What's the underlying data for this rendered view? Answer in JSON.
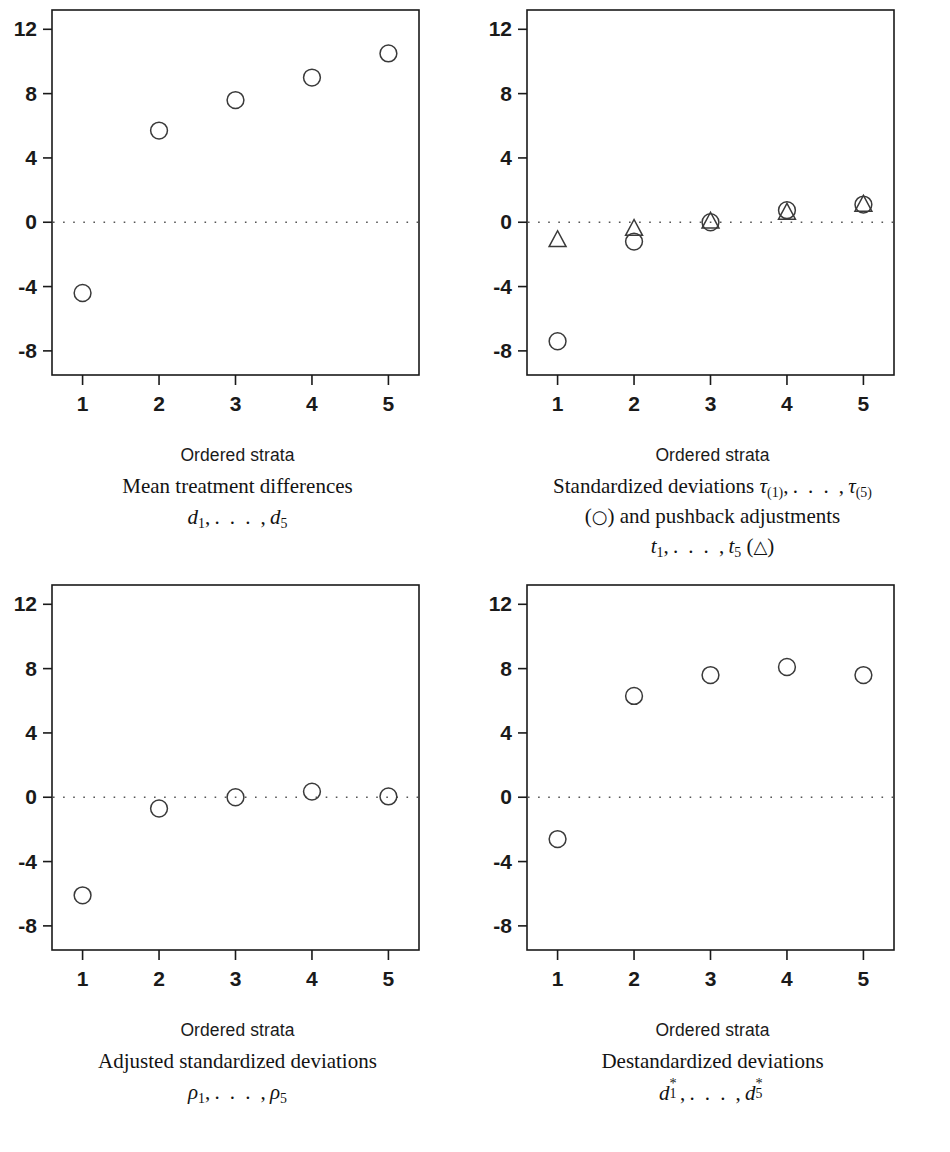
{
  "figure": {
    "background": "#ffffff",
    "ink": "#1a1a1a",
    "marker_color": "#3a3a3a",
    "reference_line_color": "#555555"
  },
  "axis": {
    "y_ticks": [
      "12",
      "8",
      "4",
      "0",
      "-4",
      "-8"
    ],
    "y_tick_values": [
      12,
      8,
      4,
      0,
      -4,
      -8
    ],
    "x_ticks": [
      "1",
      "2",
      "3",
      "4",
      "5"
    ],
    "x_tick_values": [
      1,
      2,
      3,
      4,
      5
    ],
    "ylim": [
      -9.5,
      13.2
    ],
    "xlim": [
      0.6,
      5.4
    ],
    "xlabel": "Ordered strata"
  },
  "panels": [
    {
      "id": "top-left",
      "caption_line1": "Mean treatment differences",
      "caption_math": "d_1, ..., d_5"
    },
    {
      "id": "top-right",
      "caption_line1": "Standardized deviations",
      "caption_line2": "and pushback adjustments",
      "caption_math": "t_1, ..., t_5"
    },
    {
      "id": "bottom-left",
      "caption_line1": "Adjusted standardized deviations",
      "caption_math": "rho_1, ..., rho_5"
    },
    {
      "id": "bottom-right",
      "caption_line1": "Destandardized deviations",
      "caption_math": "d*_1, ..., d*_5"
    }
  ],
  "chart_data": [
    {
      "type": "scatter",
      "id": "mean-treatment-differences",
      "title": "Mean treatment differences d_1,...,d_5",
      "xlabel": "Ordered strata",
      "ylabel": "",
      "xlim": [
        0.6,
        5.4
      ],
      "ylim": [
        -9.5,
        13.2
      ],
      "grid": false,
      "reference_line_y": 0,
      "x": [
        1,
        2,
        3,
        4,
        5
      ],
      "series": [
        {
          "name": "d",
          "marker": "circle",
          "values": [
            -4.4,
            5.7,
            7.6,
            9.0,
            10.5
          ]
        }
      ]
    },
    {
      "type": "scatter",
      "id": "standardized-deviations-and-pushback",
      "title": "Standardized deviations tau_(1),...,tau_(5) (circle) and pushback adjustments t_1,...,t_5 (triangle)",
      "xlabel": "Ordered strata",
      "ylabel": "",
      "xlim": [
        0.6,
        5.4
      ],
      "ylim": [
        -9.5,
        13.2
      ],
      "grid": false,
      "reference_line_y": 0,
      "x": [
        1,
        2,
        3,
        4,
        5
      ],
      "series": [
        {
          "name": "tau (circle)",
          "marker": "circle",
          "values": [
            -7.4,
            -1.2,
            0.0,
            0.75,
            1.1
          ]
        },
        {
          "name": "t (triangle)",
          "marker": "triangle",
          "values": [
            -1.1,
            -0.4,
            0.05,
            0.6,
            1.1
          ]
        }
      ]
    },
    {
      "type": "scatter",
      "id": "adjusted-standardized-deviations",
      "title": "Adjusted standardized deviations rho_1,...,rho_5",
      "xlabel": "Ordered strata",
      "ylabel": "",
      "xlim": [
        0.6,
        5.4
      ],
      "ylim": [
        -9.5,
        13.2
      ],
      "grid": false,
      "reference_line_y": 0,
      "x": [
        1,
        2,
        3,
        4,
        5
      ],
      "series": [
        {
          "name": "rho",
          "marker": "circle",
          "values": [
            -6.1,
            -0.7,
            0.0,
            0.35,
            0.05
          ]
        }
      ]
    },
    {
      "type": "scatter",
      "id": "destandardized-deviations",
      "title": "Destandardized deviations d*_1,...,d*_5",
      "xlabel": "Ordered strata",
      "ylabel": "",
      "xlim": [
        0.6,
        5.4
      ],
      "ylim": [
        -9.5,
        13.2
      ],
      "grid": false,
      "reference_line_y": 0,
      "x": [
        1,
        2,
        3,
        4,
        5
      ],
      "series": [
        {
          "name": "d*",
          "marker": "circle",
          "values": [
            -2.6,
            6.3,
            7.6,
            8.1,
            7.6
          ]
        }
      ]
    }
  ]
}
